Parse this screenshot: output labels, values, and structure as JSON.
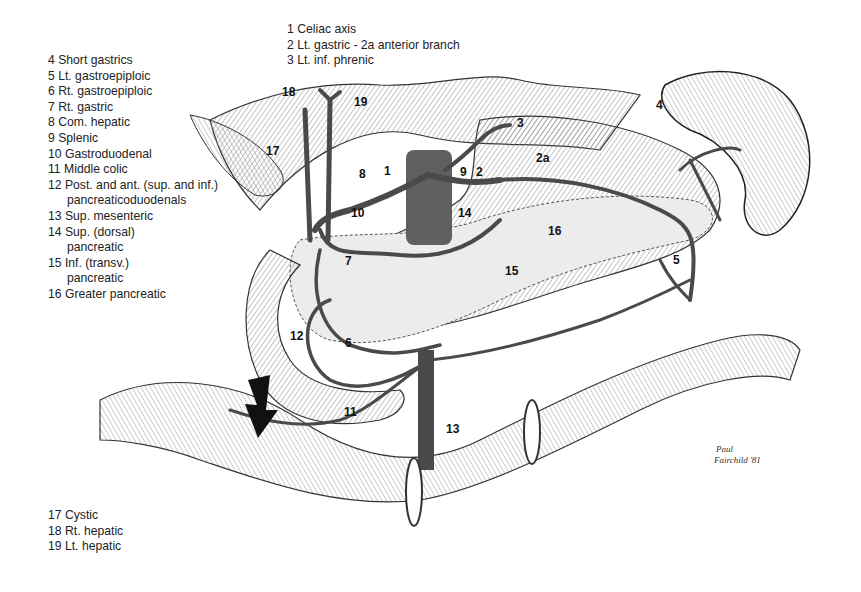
{
  "legend_top": [
    {
      "num": "1",
      "text": "Celiac axis"
    },
    {
      "num": "2",
      "text": "Lt. gastric - 2a anterior branch"
    },
    {
      "num": "3",
      "text": "Lt. inf. phrenic"
    }
  ],
  "legend_left": [
    {
      "num": "4",
      "text": "Short gastrics"
    },
    {
      "num": "5",
      "text": "Lt. gastroepiploic"
    },
    {
      "num": "6",
      "text": "Rt. gastroepiploic"
    },
    {
      "num": "7",
      "text": "Rt. gastric"
    },
    {
      "num": "8",
      "text": "Com. hepatic"
    },
    {
      "num": "9",
      "text": "Splenic"
    },
    {
      "num": "10",
      "text": "Gastroduodenal"
    },
    {
      "num": "11",
      "text": "Middle colic"
    },
    {
      "num": "12",
      "text": "Post. and ant. (sup. and inf.)",
      "cont": "pancreaticoduodenals"
    },
    {
      "num": "13",
      "text": "Sup. mesenteric"
    },
    {
      "num": "14",
      "text": "Sup. (dorsal)",
      "cont": "pancreatic"
    },
    {
      "num": "15",
      "text": "Inf. (transv.)",
      "cont": "pancreatic"
    },
    {
      "num": "16",
      "text": "Greater pancreatic"
    }
  ],
  "legend_bottom": [
    {
      "num": "17",
      "text": "Cystic"
    },
    {
      "num": "18",
      "text": "Rt. hepatic"
    },
    {
      "num": "19",
      "text": "Lt. hepatic"
    }
  ],
  "callouts": {
    "c1": "1",
    "c2": "2",
    "c2a": "2a",
    "c3": "3",
    "c4": "4",
    "c5": "5",
    "c6": "6",
    "c7": "7",
    "c8": "8",
    "c9": "9",
    "c10": "10",
    "c11": "11",
    "c12": "12",
    "c13": "13",
    "c14": "14",
    "c15": "15",
    "c16": "16",
    "c17": "17",
    "c18": "18",
    "c19": "19"
  },
  "signature": {
    "line1": "Paul",
    "line2": "Fairchild '81"
  },
  "colors": {
    "vessel": "#4a4a4a",
    "aorta": "#5a5a5a",
    "organ_fill": "#e6e6e6",
    "hatch": "#888888"
  }
}
